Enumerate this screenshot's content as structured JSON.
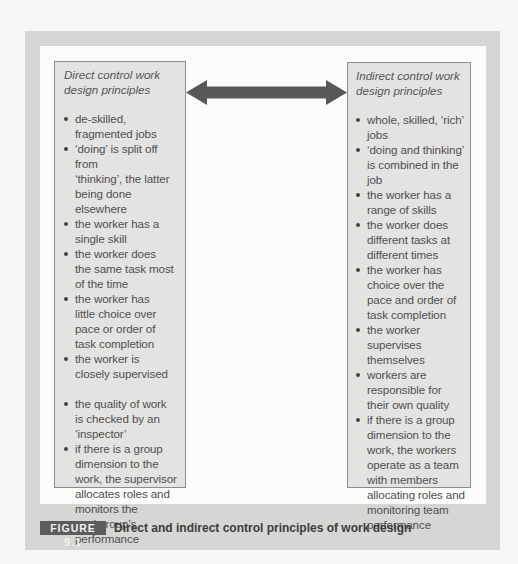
{
  "figure": {
    "label": "FIGURE 9.1",
    "caption": "Direct and indirect control principles of work design"
  },
  "arrow": {
    "type": "double-headed",
    "color": "#585858"
  },
  "colors": {
    "outer_frame": "#d6d6d5",
    "inner_panel": "#fbfbfa",
    "box_fill": "#e3e3e2",
    "box_border": "#8c8c8c",
    "caption_label_bg": "#5c5c5c"
  },
  "left_box": {
    "title_line1": "Direct control work",
    "title_line2": "design principles",
    "items": [
      [
        "de-skilled,",
        "fragmented jobs"
      ],
      [
        "‘doing’ is split off from",
        "‘thinking’, the latter",
        "being done elsewhere"
      ],
      [
        "the worker has a",
        "single skill"
      ],
      [
        "the worker does",
        "the same task most",
        "of the time"
      ],
      [
        "the worker has",
        "little choice over",
        "pace or order of",
        "task completion"
      ],
      [
        "the worker is",
        "closely supervised"
      ],
      [
        "the quality of work",
        "is checked by an",
        "‘inspector’"
      ],
      [
        "if there is a group",
        "dimension to the",
        "work, the supervisor",
        "allocates roles and",
        "monitors the",
        "workgroup’s",
        "performance"
      ]
    ]
  },
  "right_box": {
    "title_line1": "Indirect control work",
    "title_line2": "design principles",
    "items": [
      [
        "whole, skilled, ‘rich’",
        "jobs"
      ],
      [
        "‘doing and thinking’",
        "is combined in the",
        "job"
      ],
      [
        "the worker has a",
        "range of skills"
      ],
      [
        "the worker does",
        "different tasks at",
        "different times"
      ],
      [
        "the worker has",
        "choice over the",
        "pace and order of",
        "task completion"
      ],
      [
        "the worker",
        "supervises",
        "themselves"
      ],
      [
        "workers are",
        "responsible for",
        "their own quality"
      ],
      [
        "if there is a group",
        "dimension to the",
        "work, the workers",
        "operate as a team",
        "with members",
        "allocating roles and",
        "monitoring team",
        "performance"
      ]
    ]
  }
}
